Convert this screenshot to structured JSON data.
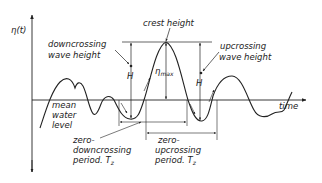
{
  "diagram": {
    "axis_labels": {
      "y": "η(t)",
      "x": "time"
    },
    "labels": {
      "crest_height": "crest height",
      "downcrossing_line1": "downcrossing",
      "downcrossing_line2": "wave height",
      "upcrossing_line1": "upcrossing",
      "upcrossing_line2": "wave height",
      "H_left": "H",
      "H_right": "H",
      "eta_max_main": "η",
      "eta_max_sub": "max",
      "mwl_line1": "mean",
      "mwl_line2": "water",
      "mwl_line3": "level",
      "zd_line1": "zero-",
      "zd_line2": "downcrossing",
      "zd_line3": "period. T",
      "zd_sub": "z",
      "zu_line1": "zero-",
      "zu_line2": "upcrossing",
      "zu_line3": "period. T",
      "zu_sub": "z"
    },
    "colors": {
      "ink": "#222222",
      "background": "#ffffff"
    }
  }
}
